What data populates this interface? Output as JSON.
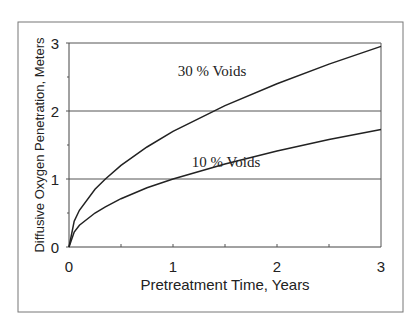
{
  "chart_data": {
    "type": "line",
    "title": "",
    "xlabel": "Pretreatment Time, Years",
    "ylabel": "Diffusive Oxygen Penetration, Meters",
    "xlim": [
      0,
      3
    ],
    "ylim": [
      0,
      3
    ],
    "xticks": [
      "0",
      "1",
      "2",
      "3"
    ],
    "yticks": [
      "0",
      "1",
      "2",
      "3"
    ],
    "grid": "horizontal",
    "legend": "none (inline annotations)",
    "x": [
      0,
      0.05,
      0.1,
      0.25,
      0.35,
      0.5,
      0.75,
      1.0,
      1.5,
      2.0,
      2.5,
      3.0
    ],
    "series": [
      {
        "name": "30 % Voids",
        "values": [
          0,
          0.38,
          0.54,
          0.85,
          1.0,
          1.2,
          1.47,
          1.7,
          2.08,
          2.4,
          2.69,
          2.95
        ]
      },
      {
        "name": "10 % Voids",
        "values": [
          0,
          0.22,
          0.32,
          0.5,
          0.59,
          0.71,
          0.87,
          1.0,
          1.22,
          1.41,
          1.58,
          1.73
        ]
      }
    ],
    "annotations": [
      {
        "text": "30 % Voids",
        "x": 1.35,
        "y": 2.55
      },
      {
        "text": "10 % Voids",
        "x": 1.45,
        "y": 1.2
      }
    ]
  },
  "labels": {
    "x_axis": "Pretreatment Time, Years",
    "y_axis": "Diffusive Oxygen Penetration, Meters",
    "ann30": "30 % Voids",
    "ann10": "10 % Voids",
    "xt0": "0",
    "xt1": "1",
    "xt2": "2",
    "xt3": "3",
    "yt0": "0",
    "yt1": "1",
    "yt2": "2",
    "yt3": "3"
  }
}
